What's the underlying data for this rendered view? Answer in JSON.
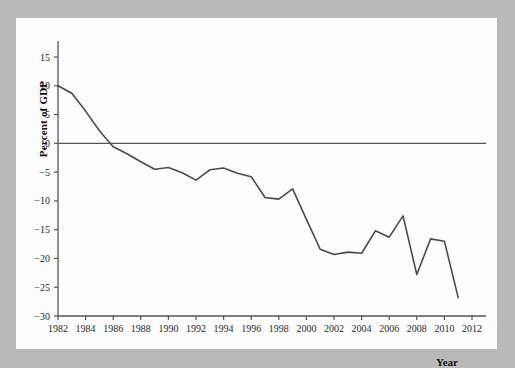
{
  "figure": {
    "background_color": "#b9b9b9",
    "paper_color": "#fdfdfd",
    "line_color": "#4a4a4a",
    "axis_color": "#555555"
  },
  "axes": {
    "ylabel": "Percent of GDP",
    "xlabel": "Year",
    "y_ticks": [
      "15",
      "10",
      "5",
      "0",
      "−5",
      "−10",
      "−15",
      "−20",
      "−25",
      "−30"
    ],
    "x_ticks": [
      "1982",
      "1984",
      "1986",
      "1988",
      "1990",
      "1992",
      "1994",
      "1996",
      "1998",
      "2000",
      "2002",
      "2004",
      "2006",
      "2008",
      "2010",
      "2012"
    ]
  },
  "chart_data": {
    "type": "line",
    "title": "",
    "xlabel": "Year",
    "ylabel": "Percent of GDP",
    "xlim": [
      1982,
      2012
    ],
    "ylim": [
      -30,
      17
    ],
    "grid": false,
    "legend": null,
    "zero_line": 0,
    "x": [
      1982,
      1983,
      1984,
      1985,
      1986,
      1987,
      1988,
      1989,
      1990,
      1991,
      1992,
      1993,
      1994,
      1995,
      1996,
      1997,
      1998,
      1999,
      2000,
      2001,
      2002,
      2003,
      2004,
      2005,
      2006,
      2007,
      2008,
      2009,
      2010,
      2011
    ],
    "values": [
      10.0,
      8.7,
      5.6,
      2.2,
      -0.6,
      -1.8,
      -3.2,
      -4.5,
      -4.2,
      -5.1,
      -6.4,
      -4.6,
      -4.3,
      -5.2,
      -5.8,
      -9.4,
      -9.7,
      -7.9,
      -13.2,
      -18.4,
      -19.3,
      -18.9,
      -19.1,
      -15.2,
      -16.3,
      -12.6,
      -22.8,
      -16.6,
      -17.0,
      -26.8
    ],
    "series_name": "Percent of GDP"
  }
}
